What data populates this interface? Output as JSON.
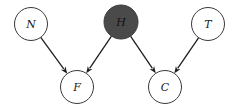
{
  "diagram": {
    "type": "directed-graphical-model",
    "width": 237,
    "height": 110,
    "colors": {
      "background": "#ffffff",
      "node_stroke": "#3a3a3a",
      "node_fill_default": "#ffffff",
      "node_fill_observed": "#4a4a4a",
      "label_default": "#222222",
      "label_observed": "#111111",
      "edge": "#1e1e1e"
    },
    "nodes": [
      {
        "id": "N",
        "label": "N",
        "cx": 31,
        "cy": 24,
        "r": 16.5,
        "observed": false
      },
      {
        "id": "H",
        "label": "H",
        "cx": 121,
        "cy": 22,
        "r": 17,
        "observed": true
      },
      {
        "id": "T",
        "label": "T",
        "cx": 208,
        "cy": 24,
        "r": 16.5,
        "observed": false
      },
      {
        "id": "F",
        "label": "F",
        "cx": 77,
        "cy": 87,
        "r": 16.5,
        "observed": false
      },
      {
        "id": "C",
        "label": "C",
        "cx": 165,
        "cy": 87,
        "r": 16.5,
        "observed": false
      }
    ],
    "edges": [
      {
        "from": "N",
        "to": "F"
      },
      {
        "from": "H",
        "to": "F"
      },
      {
        "from": "H",
        "to": "C"
      },
      {
        "from": "T",
        "to": "C"
      }
    ]
  }
}
